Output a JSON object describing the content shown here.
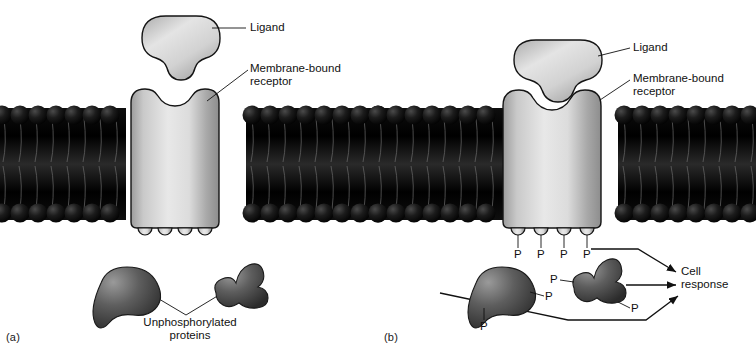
{
  "figure": {
    "type": "diagram",
    "panels": [
      {
        "id": "a",
        "panel_label": "(a)",
        "state": "ligand unbound, receptor inactive",
        "labels": {
          "ligand": "Ligand",
          "receptor": "Membrane-bound\nreceptor",
          "proteins": "Unphosphorylated\nproteins"
        },
        "ligand_bound": false,
        "receptor_tail_bumps": 4,
        "phosphate_count": 0,
        "cytoplasmic_proteins": 2
      },
      {
        "id": "b",
        "panel_label": "(b)",
        "state": "ligand bound, receptor autophosphorylated, proteins phosphorylated",
        "labels": {
          "ligand": "Ligand",
          "receptor": "Membrane-bound\nreceptor",
          "cell_response": "Cell\nresponse"
        },
        "ligand_bound": true,
        "receptor_tail_bumps": 4,
        "receptor_phosphates": [
          "P",
          "P",
          "P",
          "P"
        ],
        "protein_left_phosphates": [
          "P",
          "P"
        ],
        "protein_right_phosphates": [
          "P",
          "P"
        ],
        "cytoplasmic_proteins": 2,
        "response_arrows": 3
      }
    ],
    "colors": {
      "membrane": "#0a0a0a",
      "membrane_head": "#141414",
      "receptor_light": "#e6e6e6",
      "receptor_mid": "#bdbdbd",
      "receptor_dark": "#8f8f8f",
      "protein_light": "#8c8c8c",
      "protein_dark": "#3a3a3a",
      "outline": "#111111",
      "text": "#111111",
      "background": "#ffffff"
    },
    "geometry": {
      "membrane_top_y": 108,
      "membrane_bottom_y": 220,
      "panel_width": 378,
      "canvas": [
        756,
        349
      ]
    }
  }
}
